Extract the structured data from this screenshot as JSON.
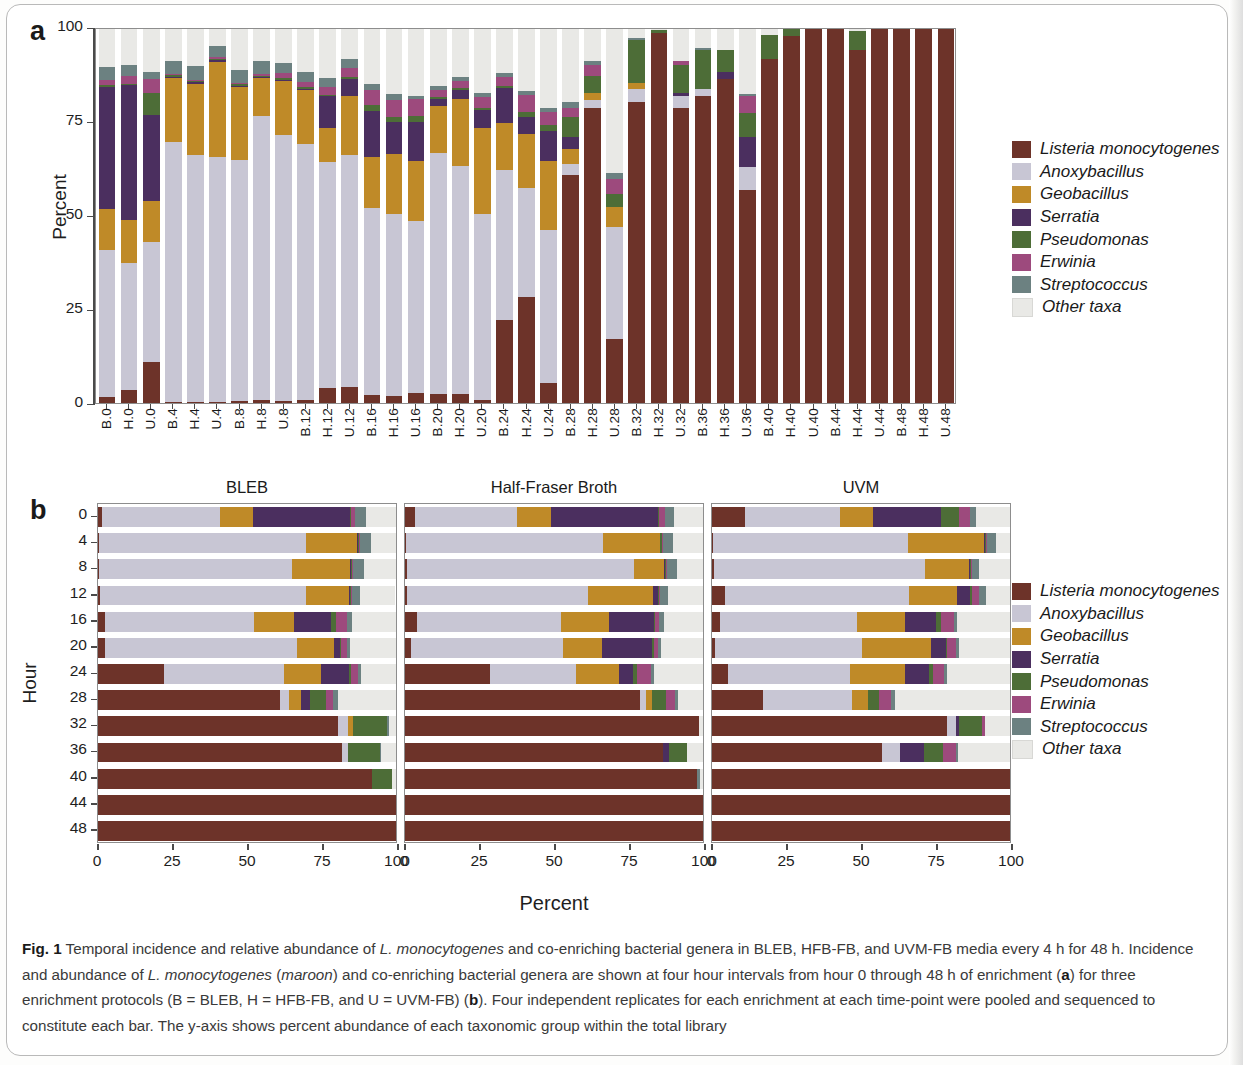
{
  "figure": {
    "label": "Fig. 1",
    "panel_a_letter": "a",
    "panel_b_letter": "b",
    "caption_parts": {
      "p1": " Temporal incidence and relative abundance of ",
      "i1": "L. monocytogenes",
      "p2": " and co-enriching bacterial genera in BLEB, HFB-FB, and UVM-FB media every 4 h for 48 h. Incidence and abundance of ",
      "i2": "L. monocytogenes",
      "p3": " (",
      "i3": "maroon",
      "p4": ") and co-enriching bacterial genera are shown at four hour intervals from hour 0 through 48 h of enrichment (",
      "b1": "a",
      "p5": ") for three enrichment protocols (B = BLEB, H = HFB-FB, and U = UVM-FB) (",
      "b2": "b",
      "p6": "). Four independent replicates for each enrichment at each time-point were pooled and sequenced to constitute each bar. The y-axis shows percent abundance of each taxonomic group within the total library"
    }
  },
  "colors": {
    "listeria": "#6d3329",
    "anoxybacillus": "#c8c6d4",
    "geobacillus": "#bf8a28",
    "serratia": "#4b2f5f",
    "pseudomonas": "#4d6d37",
    "erwinia": "#9d4a7d",
    "streptococcus": "#6c8181",
    "other": "#e9e9e6"
  },
  "legend": {
    "items": [
      {
        "label": "Listeria monocytogenes",
        "color_key": "listeria"
      },
      {
        "label": "Anoxybacillus",
        "color_key": "anoxybacillus"
      },
      {
        "label": "Geobacillus",
        "color_key": "geobacillus"
      },
      {
        "label": "Serratia",
        "color_key": "serratia"
      },
      {
        "label": "Pseudomonas",
        "color_key": "pseudomonas"
      },
      {
        "label": "Erwinia",
        "color_key": "erwinia"
      },
      {
        "label": "Streptococcus",
        "color_key": "streptococcus"
      },
      {
        "label": "Other taxa",
        "color_key": "other"
      }
    ]
  },
  "chart_data": [
    {
      "id": "panel_a",
      "type": "bar",
      "orientation": "vertical",
      "stacked": true,
      "title": "",
      "xlabel": "",
      "ylabel": "Percent",
      "ylim": [
        0,
        100
      ],
      "yticks": [
        0,
        25,
        50,
        75,
        100
      ],
      "grid": false,
      "legend_position": "right",
      "categories": [
        "B.0",
        "H.0",
        "U.0",
        "B.4",
        "H.4",
        "U.4",
        "B.8",
        "H.8",
        "U.8",
        "B.12",
        "H.12",
        "U.12",
        "B.16",
        "H.16",
        "U.16",
        "B.20",
        "H.20",
        "U.20",
        "B.24",
        "H.24",
        "U.24",
        "B.28",
        "H.28",
        "U.28",
        "B.32",
        "H.32",
        "U.32",
        "B.36",
        "H.36",
        "U.36",
        "B.40",
        "H.40",
        "U.40",
        "B.44",
        "H.44",
        "U.44",
        "B.48",
        "H.48",
        "U.48"
      ],
      "series": [
        {
          "name": "Listeria monocytogenes",
          "color_key": "listeria",
          "values": [
            1.5,
            3.5,
            11.0,
            0.4,
            0.4,
            0.3,
            0.5,
            0.8,
            0.6,
            0.7,
            4.0,
            4.2,
            2.2,
            2.0,
            2.7,
            2.3,
            2.3,
            0.9,
            22.3,
            28.4,
            5.3,
            61.0,
            79.0,
            17.0,
            80.5,
            98.8,
            78.8,
            82.0,
            86.5,
            57.0,
            92.0,
            98.0,
            100.0,
            100.0,
            94.5,
            100.0,
            100.0,
            100.0,
            100.0
          ]
        },
        {
          "name": "Anoxybacillus",
          "color_key": "anoxybacillus",
          "values": [
            39.5,
            34.0,
            32.0,
            69.5,
            66.0,
            65.5,
            64.5,
            76.0,
            71.0,
            68.5,
            60.5,
            62.0,
            50.0,
            48.5,
            46.0,
            64.5,
            61.0,
            49.5,
            40.0,
            29.0,
            41.0,
            3.0,
            2.0,
            30.0,
            3.5,
            0.0,
            3.2,
            2.0,
            0.0,
            6.0,
            0.0,
            0.0,
            0.0,
            0.0,
            0.0,
            0.0,
            0.0,
            0.0,
            0.0
          ]
        },
        {
          "name": "Geobacillus",
          "color_key": "geobacillus",
          "values": [
            11.0,
            11.5,
            11.0,
            17.0,
            19.0,
            25.5,
            19.5,
            10.0,
            14.5,
            14.5,
            9.0,
            16.0,
            13.5,
            16.0,
            16.0,
            12.5,
            18.0,
            23.0,
            12.5,
            14.5,
            18.5,
            4.0,
            2.0,
            5.5,
            1.5,
            0.0,
            0.0,
            0.0,
            0.0,
            0.0,
            0.0,
            0.0,
            0.0,
            0.0,
            0.0,
            0.0,
            0.0,
            0.0,
            0.0
          ]
        },
        {
          "name": "Serratia",
          "color_key": "serratia",
          "values": [
            32.5,
            36.0,
            23.0,
            0.3,
            0.3,
            0.3,
            0.3,
            0.3,
            0.3,
            0.3,
            8.5,
            4.5,
            12.5,
            8.5,
            10.5,
            2.0,
            2.5,
            5.0,
            9.5,
            4.5,
            8.0,
            3.0,
            0.0,
            0.0,
            0.0,
            0.0,
            1.0,
            0.0,
            2.0,
            8.0,
            0.0,
            0.0,
            0.0,
            0.0,
            0.0,
            0.0,
            0.0,
            0.0,
            0.0
          ]
        },
        {
          "name": "Pseudomonas",
          "color_key": "pseudomonas",
          "values": [
            0.4,
            0.4,
            6.0,
            0.4,
            0.4,
            0.4,
            0.4,
            0.4,
            0.4,
            0.4,
            0.4,
            0.4,
            1.5,
            1.5,
            1.5,
            0.4,
            0.4,
            0.4,
            0.5,
            1.5,
            1.5,
            5.5,
            4.5,
            3.5,
            11.5,
            0.8,
            7.5,
            10.5,
            6.0,
            6.5,
            6.5,
            2.0,
            0.0,
            0.0,
            5.0,
            0.0,
            0.0,
            0.0,
            0.0
          ]
        },
        {
          "name": "Erwinia",
          "color_key": "erwinia",
          "values": [
            1.5,
            2.0,
            3.5,
            0.4,
            0.4,
            0.4,
            0.4,
            0.4,
            1.5,
            1.5,
            2.0,
            2.5,
            4.0,
            4.5,
            4.5,
            2.0,
            2.0,
            3.0,
            2.5,
            4.5,
            3.5,
            2.5,
            3.0,
            4.0,
            0.0,
            0.0,
            1.0,
            0.0,
            0.0,
            4.5,
            0.0,
            0.0,
            0.0,
            0.0,
            0.0,
            0.0,
            0.0,
            0.0,
            0.0
          ]
        },
        {
          "name": "Streptococcus",
          "color_key": "streptococcus",
          "values": [
            3.5,
            3.0,
            2.0,
            3.5,
            3.5,
            3.0,
            3.5,
            3.5,
            2.5,
            2.5,
            2.5,
            2.5,
            1.5,
            1.5,
            1.0,
            1.0,
            1.0,
            1.0,
            1.0,
            1.0,
            1.0,
            1.5,
            1.0,
            1.5,
            0.5,
            0.0,
            0.0,
            0.5,
            0.0,
            0.5,
            0.0,
            0.0,
            0.0,
            0.0,
            0.0,
            0.0,
            0.0,
            0.0,
            0.0
          ]
        },
        {
          "name": "Other taxa",
          "color_key": "other",
          "values": [
            10.1,
            9.6,
            11.5,
            8.5,
            10.0,
            4.6,
            10.9,
            8.6,
            9.2,
            11.6,
            13.1,
            7.9,
            14.8,
            17.5,
            17.8,
            15.3,
            12.8,
            17.2,
            11.7,
            16.6,
            21.2,
            19.5,
            8.5,
            38.5,
            2.5,
            0.4,
            8.5,
            5.0,
            5.5,
            17.5,
            1.5,
            0.0,
            0.0,
            0.0,
            0.5,
            0.0,
            0.0,
            0.0,
            0.0
          ]
        }
      ]
    },
    {
      "id": "panel_b_bleb",
      "type": "bar",
      "orientation": "horizontal",
      "stacked": true,
      "title": "BLEB",
      "xlabel": "Percent",
      "ylabel": "Hour",
      "xlim": [
        0,
        100
      ],
      "xticks": [
        0,
        25,
        50,
        75,
        100
      ],
      "categories": [
        "0",
        "4",
        "8",
        "12",
        "16",
        "20",
        "24",
        "28",
        "32",
        "36",
        "40",
        "44",
        "48"
      ],
      "series": [
        {
          "name": "Listeria monocytogenes",
          "color_key": "listeria",
          "values": [
            1.5,
            0.4,
            0.5,
            0.7,
            2.2,
            2.3,
            22.3,
            61.0,
            80.5,
            82.0,
            92.0,
            100.0,
            100.0
          ]
        },
        {
          "name": "Anoxybacillus",
          "color_key": "anoxybacillus",
          "values": [
            39.5,
            69.5,
            64.5,
            68.5,
            50.0,
            64.5,
            40.0,
            3.0,
            3.5,
            2.0,
            0.0,
            0.0,
            0.0
          ]
        },
        {
          "name": "Geobacillus",
          "color_key": "geobacillus",
          "values": [
            11.0,
            17.0,
            19.5,
            14.5,
            13.5,
            12.5,
            12.5,
            4.0,
            1.5,
            0.0,
            0.0,
            0.0,
            0.0
          ]
        },
        {
          "name": "Serratia",
          "color_key": "serratia",
          "values": [
            32.5,
            0.3,
            0.3,
            0.3,
            12.5,
            2.0,
            9.5,
            3.0,
            0.0,
            0.0,
            0.0,
            0.0,
            0.0
          ]
        },
        {
          "name": "Pseudomonas",
          "color_key": "pseudomonas",
          "values": [
            0.4,
            0.4,
            0.4,
            0.4,
            1.5,
            0.4,
            0.5,
            5.5,
            11.5,
            10.5,
            6.5,
            0.0,
            0.0
          ]
        },
        {
          "name": "Erwinia",
          "color_key": "erwinia",
          "values": [
            1.5,
            0.4,
            0.4,
            0.4,
            4.0,
            2.0,
            2.5,
            2.5,
            0.0,
            0.0,
            0.0,
            0.0,
            0.0
          ]
        },
        {
          "name": "Streptococcus",
          "color_key": "streptococcus",
          "values": [
            3.5,
            3.5,
            3.5,
            2.5,
            1.5,
            1.0,
            1.0,
            1.5,
            0.5,
            0.5,
            0.0,
            0.0,
            0.0
          ]
        },
        {
          "name": "Other taxa",
          "color_key": "other",
          "values": [
            10.1,
            8.5,
            10.9,
            11.6,
            14.8,
            15.3,
            11.7,
            19.5,
            2.5,
            5.0,
            1.5,
            0.0,
            0.0
          ]
        }
      ]
    },
    {
      "id": "panel_b_hfb",
      "type": "bar",
      "orientation": "horizontal",
      "stacked": true,
      "title": "Half-Fraser Broth",
      "xlabel": "Percent",
      "ylabel": "Hour",
      "xlim": [
        0,
        100
      ],
      "xticks": [
        0,
        25,
        50,
        75,
        100
      ],
      "categories": [
        "0",
        "4",
        "8",
        "12",
        "16",
        "20",
        "24",
        "28",
        "32",
        "36",
        "40",
        "44",
        "48"
      ],
      "series": [
        {
          "name": "Listeria monocytogenes",
          "color_key": "listeria",
          "values": [
            3.5,
            0.4,
            0.8,
            0.8,
            4.0,
            2.0,
            28.4,
            79.0,
            98.8,
            86.5,
            98.0,
            100.0,
            100.0
          ]
        },
        {
          "name": "Anoxybacillus",
          "color_key": "anoxybacillus",
          "values": [
            34.0,
            66.0,
            76.0,
            60.5,
            48.5,
            51.0,
            29.0,
            2.0,
            0.0,
            0.0,
            0.0,
            0.0,
            0.0
          ]
        },
        {
          "name": "Geobacillus",
          "color_key": "geobacillus",
          "values": [
            11.5,
            19.0,
            10.0,
            22.0,
            16.0,
            13.0,
            14.5,
            2.0,
            0.0,
            0.0,
            0.0,
            0.0,
            0.0
          ]
        },
        {
          "name": "Serratia",
          "color_key": "serratia",
          "values": [
            36.0,
            0.3,
            0.3,
            1.5,
            15.0,
            17.0,
            4.5,
            0.0,
            0.0,
            2.0,
            0.0,
            0.0,
            0.0
          ]
        },
        {
          "name": "Pseudomonas",
          "color_key": "pseudomonas",
          "values": [
            0.4,
            0.4,
            0.4,
            0.4,
            0.4,
            0.4,
            1.5,
            4.5,
            0.0,
            6.0,
            0.0,
            0.0,
            0.0
          ]
        },
        {
          "name": "Erwinia",
          "color_key": "erwinia",
          "values": [
            2.0,
            0.4,
            0.4,
            0.4,
            1.5,
            1.5,
            4.5,
            3.0,
            0.0,
            0.0,
            0.0,
            0.0,
            0.0
          ]
        },
        {
          "name": "Streptococcus",
          "color_key": "streptococcus",
          "values": [
            3.0,
            3.5,
            3.5,
            2.5,
            1.5,
            1.0,
            1.0,
            1.0,
            0.0,
            0.0,
            1.0,
            0.0,
            0.0
          ]
        },
        {
          "name": "Other taxa",
          "color_key": "other",
          "values": [
            9.6,
            10.0,
            8.6,
            11.9,
            13.1,
            14.1,
            16.6,
            8.5,
            1.2,
            5.5,
            1.0,
            0.0,
            0.0
          ]
        }
      ]
    },
    {
      "id": "panel_b_uvm",
      "type": "bar",
      "orientation": "horizontal",
      "stacked": true,
      "title": "UVM",
      "xlabel": "Percent",
      "ylabel": "Hour",
      "xlim": [
        0,
        100
      ],
      "xticks": [
        0,
        25,
        50,
        75,
        100
      ],
      "categories": [
        "0",
        "4",
        "8",
        "12",
        "16",
        "20",
        "24",
        "28",
        "32",
        "36",
        "40",
        "44",
        "48"
      ],
      "series": [
        {
          "name": "Listeria monocytogenes",
          "color_key": "listeria",
          "values": [
            11.0,
            0.3,
            0.6,
            4.2,
            2.7,
            0.9,
            5.3,
            17.0,
            78.8,
            57.0,
            100.0,
            100.0,
            100.0
          ]
        },
        {
          "name": "Anoxybacillus",
          "color_key": "anoxybacillus",
          "values": [
            32.0,
            65.5,
            71.0,
            62.0,
            46.0,
            49.5,
            41.0,
            30.0,
            3.2,
            6.0,
            0.0,
            0.0,
            0.0
          ]
        },
        {
          "name": "Geobacillus",
          "color_key": "geobacillus",
          "values": [
            11.0,
            25.5,
            14.5,
            16.0,
            16.0,
            23.0,
            18.5,
            5.5,
            0.0,
            0.0,
            0.0,
            0.0,
            0.0
          ]
        },
        {
          "name": "Serratia",
          "color_key": "serratia",
          "values": [
            23.0,
            0.3,
            0.3,
            4.5,
            10.5,
            5.0,
            8.0,
            0.0,
            1.0,
            8.0,
            0.0,
            0.0,
            0.0
          ]
        },
        {
          "name": "Pseudomonas",
          "color_key": "pseudomonas",
          "values": [
            6.0,
            0.4,
            0.4,
            0.4,
            1.5,
            0.4,
            1.5,
            3.5,
            7.5,
            6.5,
            0.0,
            0.0,
            0.0
          ]
        },
        {
          "name": "Erwinia",
          "color_key": "erwinia",
          "values": [
            3.5,
            0.4,
            0.4,
            2.5,
            4.5,
            3.0,
            3.5,
            4.0,
            1.0,
            4.5,
            0.0,
            0.0,
            0.0
          ]
        },
        {
          "name": "Streptococcus",
          "color_key": "streptococcus",
          "values": [
            2.0,
            3.0,
            2.5,
            2.5,
            1.0,
            1.0,
            1.0,
            1.5,
            0.0,
            0.5,
            0.0,
            0.0,
            0.0
          ]
        },
        {
          "name": "Other taxa",
          "color_key": "other",
          "values": [
            11.5,
            4.6,
            10.3,
            7.9,
            17.8,
            17.2,
            21.2,
            38.5,
            8.5,
            17.5,
            0.0,
            0.0,
            0.0
          ]
        }
      ]
    }
  ]
}
